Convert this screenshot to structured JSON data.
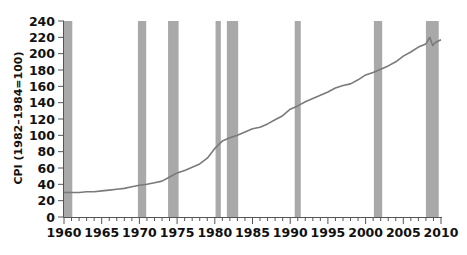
{
  "chart_data": {
    "type": "line",
    "title": "",
    "xlabel": "",
    "ylabel": "CPI (1982–1984=100)",
    "xlim": [
      1960,
      2010
    ],
    "ylim": [
      0,
      240
    ],
    "grid": false,
    "legend": null,
    "x_ticks": [
      1960,
      1965,
      1970,
      1975,
      1980,
      1985,
      1990,
      1995,
      2000,
      2005,
      2010
    ],
    "y_ticks": [
      0,
      20,
      40,
      60,
      80,
      100,
      120,
      140,
      160,
      180,
      200,
      220,
      240
    ],
    "series": [
      {
        "name": "CPI",
        "color": "#7a7a7a",
        "x": [
          1960,
          1961,
          1962,
          1963,
          1964,
          1965,
          1966,
          1967,
          1968,
          1969,
          1970,
          1971,
          1972,
          1973,
          1974,
          1975,
          1976,
          1977,
          1978,
          1979,
          1980,
          1981,
          1982,
          1983,
          1984,
          1985,
          1986,
          1987,
          1988,
          1989,
          1990,
          1991,
          1992,
          1993,
          1994,
          1995,
          1996,
          1997,
          1998,
          1999,
          2000,
          2001,
          2002,
          2003,
          2004,
          2005,
          2006,
          2007,
          2008,
          2008.5,
          2008.9,
          2009.3,
          2010
        ],
        "values": [
          30,
          30,
          30,
          31,
          31,
          32,
          33,
          34,
          35,
          37,
          39,
          40,
          42,
          44,
          49,
          54,
          57,
          61,
          65,
          72,
          84,
          93,
          97,
          100,
          104,
          108,
          110,
          114,
          119,
          124,
          132,
          136,
          141,
          145,
          149,
          153,
          158,
          161,
          163,
          168,
          174,
          177,
          181,
          185,
          190,
          197,
          202,
          208,
          212,
          220,
          210,
          214,
          217
        ]
      }
    ],
    "shaded_regions": {
      "label": "recessions",
      "color": "#a9a9a9",
      "spans": [
        [
          1960.0,
          1961.1
        ],
        [
          1969.8,
          1970.9
        ],
        [
          1973.8,
          1975.2
        ],
        [
          1980.1,
          1980.8
        ],
        [
          1981.6,
          1983.1
        ],
        [
          1990.6,
          1991.4
        ],
        [
          2001.1,
          2002.2
        ],
        [
          2008.0,
          2009.7
        ]
      ]
    }
  },
  "caption": "",
  "colors": {
    "line": "#7a7a7a",
    "recession": "#a9a9a9",
    "axis": "#555555",
    "text": "#111111"
  }
}
